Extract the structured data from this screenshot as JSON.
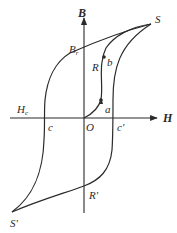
{
  "diagram": {
    "type": "hysteresis-loop",
    "colors": {
      "background": "#ffffff",
      "stroke": "#2a2a2a"
    },
    "axes": {
      "y_label": "B",
      "x_label": "H",
      "origin_label": "O"
    },
    "points": {
      "S": "S",
      "S_prime": "S'",
      "Br": "B",
      "Br_sub": "r",
      "Hc": "H",
      "Hc_sub": "c",
      "c": "c",
      "c_prime": "c'",
      "R": "R",
      "R_prime": "R'",
      "a": "a",
      "b": "b"
    }
  }
}
